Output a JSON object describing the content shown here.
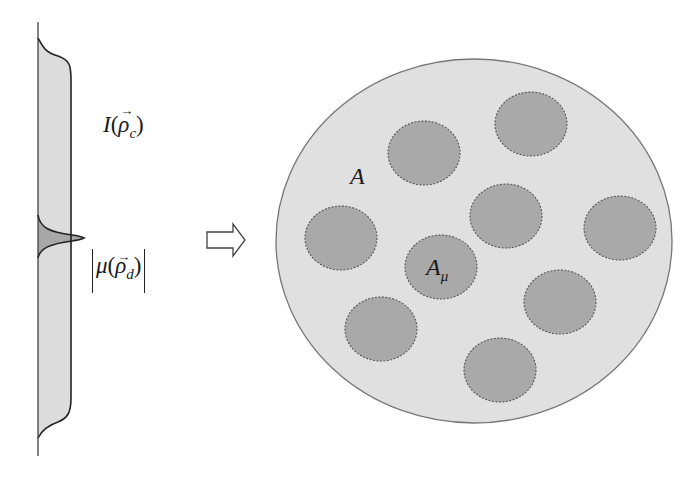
{
  "diagram": {
    "title": "",
    "profile": {
      "intensity_label": {
        "base": "I",
        "open": "(",
        "vector": "ρ",
        "subscript": "c",
        "close": ")"
      },
      "coherence_label": {
        "base": "μ",
        "open": "(",
        "vector": "ρ",
        "subscript": "d",
        "close": ")"
      },
      "colors": {
        "fill": "#dcdcdc",
        "peak_fill": "#a8a8a8",
        "stroke": "#222222"
      }
    },
    "arrow": {
      "symbol": "⇨",
      "direction": "right"
    },
    "speckle_disc": {
      "area_label": "A",
      "coherence_area_label": {
        "base": "A",
        "subscript": "μ"
      },
      "colors": {
        "fill": "#e0e0e0",
        "speckle_fill": "#a9a9a9",
        "outline": "#777777",
        "speckle_outline": "#555555"
      },
      "speckle_count": 9
    }
  }
}
